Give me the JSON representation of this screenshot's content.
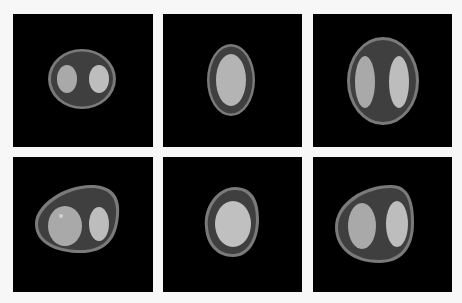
{
  "figure": {
    "background": "#f7f7f7",
    "panel_background": "#000000",
    "layout": {
      "rows": 2,
      "cols": 3
    },
    "colors": {
      "outer_ring": "#7a7a7a",
      "body": "#3f3f3f",
      "lesion_left": "#a9a9a9",
      "lesion_right": "#bdbdbd",
      "single_core": "#b4b4b4"
    },
    "panels": [
      {
        "id": "r1c1",
        "label": "phantom-1",
        "type": "oval-two-lobes",
        "x": 13,
        "y": 14,
        "w": 140,
        "h": 133
      },
      {
        "id": "r1c2",
        "label": "phantom-2",
        "type": "oval-single-core",
        "x": 163,
        "y": 14,
        "w": 139,
        "h": 133
      },
      {
        "id": "r1c3",
        "label": "phantom-3",
        "type": "egg-two-lobes",
        "x": 313,
        "y": 14,
        "w": 139,
        "h": 133
      },
      {
        "id": "r2c1",
        "label": "phantom-4",
        "type": "deformed-two-lobes",
        "x": 13,
        "y": 157,
        "w": 140,
        "h": 135
      },
      {
        "id": "r2c2",
        "label": "phantom-5",
        "type": "deformed-single-core",
        "x": 163,
        "y": 157,
        "w": 139,
        "h": 135
      },
      {
        "id": "r2c3",
        "label": "phantom-6",
        "type": "deformed-two-lobes-large",
        "x": 313,
        "y": 157,
        "w": 139,
        "h": 135
      }
    ]
  }
}
